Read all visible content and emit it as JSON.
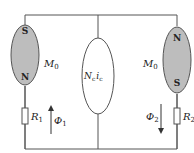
{
  "diagram": {
    "type": "magnetic-equivalent-circuit",
    "colors": {
      "line": "#555555",
      "magnet_fill": "#bdbdbd",
      "background": "#ffffff"
    },
    "left_magnet": {
      "top_pole": "S",
      "bottom_pole": "N",
      "label": "M",
      "label_sub": "0"
    },
    "right_magnet": {
      "top_pole": "N",
      "bottom_pole": "S",
      "label": "M",
      "label_sub": "0"
    },
    "center_source": {
      "label_main": "N",
      "label_main_sub": "c",
      "label_i": "i",
      "label_i_sub": "c"
    },
    "left_resistor": {
      "label": "R",
      "sub": "1"
    },
    "right_resistor": {
      "label": "R",
      "sub": "2"
    },
    "left_flux": {
      "label": "Φ",
      "sub": "1",
      "direction": "up"
    },
    "right_flux": {
      "label": "Φ",
      "sub": "2",
      "direction": "down"
    }
  }
}
